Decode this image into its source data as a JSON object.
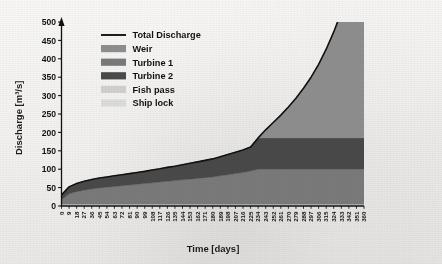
{
  "figure": {
    "background_color": "#eceae7",
    "axis_color": "#111111"
  },
  "chart_data": {
    "type": "area",
    "title": "",
    "xlabel": "Time [days]",
    "ylabel": "Discharge [m³/s]",
    "xlim": [
      0,
      360
    ],
    "ylim": [
      0,
      500
    ],
    "ytick_step": 50,
    "grid": false,
    "stacked": true,
    "legend_position": "upper-left-inside",
    "yticks": [
      0,
      50,
      100,
      150,
      200,
      250,
      300,
      350,
      400,
      450,
      500
    ],
    "categories": [
      0,
      9,
      18,
      27,
      36,
      45,
      54,
      63,
      72,
      81,
      90,
      99,
      108,
      117,
      126,
      135,
      144,
      153,
      162,
      171,
      180,
      189,
      198,
      207,
      216,
      225,
      234,
      243,
      252,
      261,
      270,
      279,
      288,
      297,
      306,
      315,
      324,
      333,
      342,
      351,
      360
    ],
    "legend": [
      {
        "label": "Total Discharge",
        "type": "line",
        "color": "#111111"
      },
      {
        "label": "Weir",
        "type": "area",
        "color": "#8e8e8e"
      },
      {
        "label": "Turbine 1",
        "type": "area",
        "color": "#7a7a7a"
      },
      {
        "label": "Turbine 2",
        "type": "area",
        "color": "#4a4a4a"
      },
      {
        "label": "Fish pass",
        "type": "area",
        "color": "#d0d0d0"
      },
      {
        "label": "Ship lock",
        "type": "area",
        "color": "#dcdcdc"
      }
    ],
    "series": [
      {
        "name": "Ship lock",
        "color": "#dcdcdc",
        "values": [
          2,
          2,
          2,
          2,
          2,
          2,
          2,
          2,
          2,
          2,
          2,
          2,
          2,
          2,
          2,
          2,
          2,
          2,
          2,
          2,
          2,
          2,
          2,
          2,
          2,
          2,
          2,
          2,
          2,
          2,
          2,
          2,
          2,
          2,
          2,
          2,
          2,
          2,
          2,
          2,
          2
        ]
      },
      {
        "name": "Fish pass",
        "color": "#d0d0d0",
        "values": [
          3,
          3,
          3,
          3,
          3,
          3,
          3,
          3,
          3,
          3,
          3,
          3,
          3,
          3,
          3,
          3,
          3,
          3,
          3,
          3,
          3,
          3,
          3,
          3,
          3,
          3,
          3,
          3,
          3,
          3,
          3,
          3,
          3,
          3,
          3,
          3,
          3,
          3,
          3,
          3,
          3
        ]
      },
      {
        "name": "Turbine 1",
        "color": "#7a7a7a",
        "values": [
          12,
          28,
          34,
          38,
          41,
          44,
          46,
          48,
          50,
          52,
          54,
          56,
          58,
          60,
          62,
          64,
          66,
          68,
          70,
          72,
          74,
          77,
          80,
          83,
          86,
          90,
          95,
          95,
          95,
          95,
          95,
          95,
          95,
          95,
          95,
          95,
          95,
          95,
          95,
          95,
          95
        ]
      },
      {
        "name": "Turbine 2",
        "color": "#4a4a4a",
        "values": [
          13,
          19,
          22,
          24,
          26,
          27,
          28,
          29,
          30,
          31,
          32,
          33,
          35,
          36,
          38,
          39,
          41,
          43,
          45,
          47,
          49,
          52,
          55,
          58,
          61,
          65,
          85,
          85,
          85,
          85,
          85,
          85,
          85,
          85,
          85,
          85,
          85,
          85,
          85,
          85,
          85
        ]
      },
      {
        "name": "Weir",
        "color": "#8e8e8e",
        "values": [
          0,
          0,
          0,
          0,
          0,
          0,
          0,
          0,
          0,
          0,
          0,
          0,
          0,
          0,
          0,
          0,
          0,
          0,
          0,
          0,
          0,
          0,
          0,
          0,
          0,
          0,
          0,
          22,
          42,
          62,
          84,
          108,
          135,
          165,
          200,
          241,
          288,
          342,
          404,
          460,
          500
        ]
      }
    ],
    "total_discharge": {
      "name": "Total Discharge",
      "color": "#111111",
      "values": [
        30,
        52,
        61,
        67,
        72,
        76,
        79,
        82,
        85,
        88,
        91,
        94,
        98,
        101,
        105,
        108,
        112,
        116,
        120,
        124,
        128,
        134,
        140,
        146,
        152,
        160,
        185,
        207,
        227,
        247,
        269,
        293,
        320,
        350,
        385,
        426,
        473,
        527,
        589,
        645,
        685
      ]
    },
    "notes": {
      "turbine_saturation_day": 234,
      "turbine1_capacity": 95,
      "turbine2_capacity": 85,
      "curve_clipped_at_top": true
    }
  }
}
